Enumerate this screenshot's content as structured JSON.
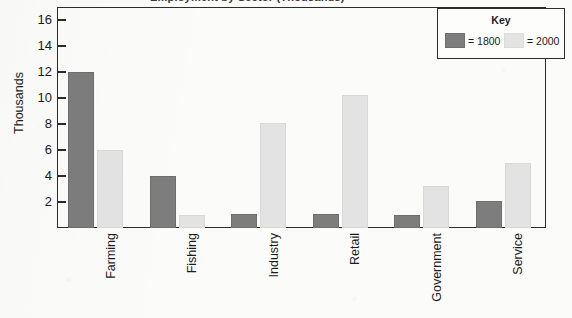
{
  "chart_data": {
    "type": "bar",
    "title": "Employment by Sector (Thousands)",
    "xlabel": "",
    "ylabel": "Thousands",
    "ylim": [
      0,
      17
    ],
    "ytick_labels": [
      "2",
      "4",
      "6",
      "8",
      "10",
      "12",
      "14",
      "16"
    ],
    "yticks": [
      2,
      4,
      6,
      8,
      10,
      12,
      14,
      16
    ],
    "grid": false,
    "legend_position": "top-right",
    "legend_title": "Key",
    "categories": [
      "Farming",
      "Fishing",
      "Industry",
      "Retail",
      "Government",
      "Service"
    ],
    "series": [
      {
        "name": "= 1800",
        "key": "1800",
        "color": "#7d7d7d",
        "values": [
          12.0,
          4.0,
          1.1,
          1.1,
          1.0,
          2.1
        ]
      },
      {
        "name": "= 2000",
        "key": "2000",
        "color": "#e3e3e3",
        "values": [
          6.0,
          1.0,
          8.1,
          10.2,
          3.2,
          5.0
        ]
      }
    ]
  },
  "axes": {
    "y_title": "Thousands"
  },
  "legend": {
    "title": "Key",
    "entries": [
      {
        "label": "= 1800",
        "color": "#7d7d7d"
      },
      {
        "label": "= 2000",
        "color": "#e3e3e3"
      }
    ]
  }
}
